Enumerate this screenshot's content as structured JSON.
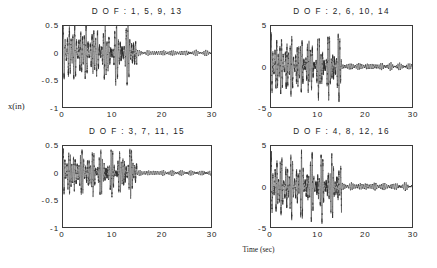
{
  "figure": {
    "xlabel": "Time (sec)",
    "ylabel": "x(in)",
    "background": "#ffffff",
    "trace_color": "#2b2b2b"
  },
  "chart_data": [
    {
      "type": "line",
      "panel": "top-left",
      "title": "D O F :  1,  5,  9,  13",
      "xlabel": "Time (sec)",
      "ylabel": "x(in)",
      "xlim": [
        0,
        30
      ],
      "ylim": [
        -1,
        0.5
      ],
      "xticks": [
        "0",
        "10",
        "20",
        "30"
      ],
      "xtick_values": [
        0,
        10,
        20,
        30
      ],
      "yticks": [
        "0.5",
        "0",
        "-0.5",
        "-1"
      ],
      "ytick_values": [
        0.5,
        0,
        -0.5,
        -1
      ],
      "grid": false,
      "legend": "none",
      "series": [
        {
          "name": "DOF 1,5,9,13 response",
          "description": "Modulated beating oscillation; excitation active 0-15 s then abrupt amplitude drop to small residual vibration until 30 s",
          "excitation_end_sec": 15,
          "carrier_freq_hz": 2.6,
          "beat_freq_hz": 0.42,
          "envelope_peak": 0.62,
          "envelope_trough": 0.2,
          "residual_amplitude": 0.05,
          "baseline": 0
        }
      ]
    },
    {
      "type": "line",
      "panel": "top-right",
      "title": "D O F :  2,  6,  10,  14",
      "xlabel": "Time (sec)",
      "ylabel": "x(in)",
      "xlim": [
        0,
        30
      ],
      "ylim": [
        -5,
        5
      ],
      "xticks": [
        "0",
        "10",
        "20",
        "30"
      ],
      "xtick_values": [
        0,
        10,
        20,
        30
      ],
      "yticks": [
        "5",
        "0",
        "-5"
      ],
      "ytick_values": [
        5,
        0,
        -5
      ],
      "grid": false,
      "legend": "none",
      "series": [
        {
          "name": "DOF 2,6,10,14 response",
          "description": "Modulated beating oscillation; excitation active 0-15 s then abrupt amplitude drop to small residual vibration until 30 s",
          "excitation_end_sec": 15,
          "carrier_freq_hz": 2.75,
          "beat_freq_hz": 0.45,
          "envelope_peak": 4.4,
          "envelope_trough": 1.1,
          "residual_amplitude": 0.42,
          "baseline": 0
        }
      ]
    },
    {
      "type": "line",
      "panel": "bottom-left",
      "title": "D O F :  3,  7,  11,  15",
      "xlabel": "Time (sec)",
      "ylabel": "x(in)",
      "xlim": [
        0,
        30
      ],
      "ylim": [
        -1,
        0.5
      ],
      "xticks": [
        "0",
        "10",
        "20",
        "30"
      ],
      "xtick_values": [
        0,
        10,
        20,
        30
      ],
      "yticks": [
        "0.5",
        "0",
        "-0.5",
        "-1"
      ],
      "ytick_values": [
        0.5,
        0,
        -0.5,
        -1
      ],
      "grid": false,
      "legend": "none",
      "series": [
        {
          "name": "DOF 3,7,11,15 response",
          "description": "Modulated beating oscillation; excitation active 0-15 s then abrupt amplitude drop to small residual vibration until 30 s",
          "excitation_end_sec": 15,
          "carrier_freq_hz": 2.9,
          "beat_freq_hz": 0.4,
          "envelope_peak": 0.5,
          "envelope_trough": 0.15,
          "residual_amplitude": 0.05,
          "baseline": 0
        }
      ]
    },
    {
      "type": "line",
      "panel": "bottom-right",
      "title": "D O F :  4,  8,  12,  16",
      "xlabel": "Time (sec)",
      "ylabel": "x(in)",
      "xlim": [
        0,
        30
      ],
      "ylim": [
        -5,
        5
      ],
      "xticks": [
        "0",
        "10",
        "20",
        "30"
      ],
      "xtick_values": [
        0,
        10,
        20,
        30
      ],
      "yticks": [
        "5",
        "0",
        "-5"
      ],
      "ytick_values": [
        5,
        0,
        -5
      ],
      "grid": false,
      "legend": "none",
      "series": [
        {
          "name": "DOF 4,8,12,16 response",
          "description": "Modulated beating oscillation; excitation active 0-15 s then abrupt amplitude drop to small residual vibration until 30 s",
          "excitation_end_sec": 15,
          "carrier_freq_hz": 2.65,
          "beat_freq_hz": 0.46,
          "envelope_peak": 4.5,
          "envelope_trough": 1.0,
          "residual_amplitude": 0.45,
          "baseline": 0
        }
      ]
    }
  ]
}
